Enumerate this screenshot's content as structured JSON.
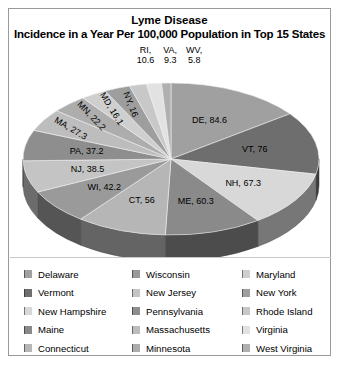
{
  "title": "Lyme Disease",
  "subtitle": "Incidence in a Year Per 100,000 Population in Top 15 States",
  "top_labels": [
    {
      "name": "RI,",
      "value": "10.6"
    },
    {
      "name": "VA,",
      "value": "9.3"
    },
    {
      "name": "WV,",
      "value": "5.8"
    }
  ],
  "legend": [
    {
      "label": "Delaware",
      "color": "#a0a0a0"
    },
    {
      "label": "Vermont",
      "color": "#6e6e6e"
    },
    {
      "label": "New Hampshire",
      "color": "#d8d8d8"
    },
    {
      "label": "Maine",
      "color": "#8a8a8a"
    },
    {
      "label": "Connecticut",
      "color": "#b6b6b6"
    },
    {
      "label": "Wisconsin",
      "color": "#9a9a9a"
    },
    {
      "label": "New Jersey",
      "color": "#c4c4c4"
    },
    {
      "label": "Pennsylvania",
      "color": "#8e8e8e"
    },
    {
      "label": "Massachusetts",
      "color": "#bdbdbd"
    },
    {
      "label": "Minnesota",
      "color": "#adadad"
    },
    {
      "label": "Maryland",
      "color": "#cfcfcf"
    },
    {
      "label": "New York",
      "color": "#9e9e9e"
    },
    {
      "label": "Rhode Island",
      "color": "#c8c8c8"
    },
    {
      "label": "Virginia",
      "color": "#e2e2e2"
    },
    {
      "label": "West Virginia",
      "color": "#b0b0b0"
    }
  ],
  "chart_data": {
    "type": "pie",
    "title": "Lyme Disease",
    "subtitle": "Incidence in a Year Per 100,000 Population in Top 15 States",
    "unit": "cases per 100,000 population",
    "three_d": true,
    "start_angle_deg": 0,
    "direction": "clockwise",
    "total": 569.4,
    "categories": [
      "Delaware",
      "Vermont",
      "New Hampshire",
      "Maine",
      "Connecticut",
      "Wisconsin",
      "New Jersey",
      "Pennsylvania",
      "Massachusetts",
      "Minnesota",
      "Maryland",
      "New York",
      "Rhode Island",
      "Virginia",
      "West Virginia"
    ],
    "values": [
      84.6,
      76,
      67.3,
      60.3,
      56,
      42.2,
      38.5,
      37.2,
      27.3,
      22.2,
      16.1,
      16,
      10.6,
      9.3,
      5.8
    ],
    "abbreviations": [
      "DE",
      "VT",
      "NH",
      "ME",
      "CT",
      "WI",
      "NJ",
      "PA",
      "MA",
      "MN",
      "MD",
      "NY",
      "RI",
      "VA",
      "WV"
    ],
    "slice_labels": [
      "DE, 84.6",
      "VT, 76",
      "NH, 67.3",
      "ME, 60.3",
      "CT, 56",
      "WI, 42.2",
      "NJ, 38.5",
      "PA, 37.2",
      "MA, 27.3",
      "MN, 22.2",
      "MD, 16.1",
      "NY, 16",
      "RI, 10.6",
      "VA, 9.3",
      "WV, 5.8"
    ],
    "colors": [
      "#a0a0a0",
      "#6e6e6e",
      "#d8d8d8",
      "#8a8a8a",
      "#b6b6b6",
      "#9a9a9a",
      "#c4c4c4",
      "#8e8e8e",
      "#bdbdbd",
      "#adadad",
      "#cfcfcf",
      "#9e9e9e",
      "#c8c8c8",
      "#e2e2e2",
      "#b0b0b0"
    ],
    "labels_outside": [
      "RI, 10.6",
      "VA, 9.3",
      "WV, 5.8"
    ],
    "legend_position": "bottom",
    "legend_columns": 3
  }
}
